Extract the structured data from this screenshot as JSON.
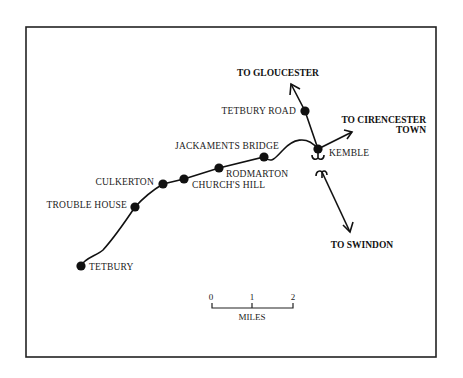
{
  "map": {
    "title": "",
    "frame": {
      "x": 26,
      "y": 27,
      "width": 410,
      "height": 330
    },
    "stations": [
      {
        "name": "TETBURY",
        "x": 81,
        "y": 266,
        "label_x": 89,
        "label_y": 270,
        "anchor": "start"
      },
      {
        "name": "TROUBLE HOUSE",
        "x": 135,
        "y": 207,
        "label_x": 127,
        "label_y": 208,
        "anchor": "end"
      },
      {
        "name": "CULKERTON",
        "x": 163,
        "y": 184,
        "label_x": 154,
        "label_y": 185,
        "anchor": "end"
      },
      {
        "name": "CHURCH'S HILL",
        "x": 184,
        "y": 179,
        "label_x": 192,
        "label_y": 188,
        "anchor": "start"
      },
      {
        "name": "RODMARTON",
        "x": 219,
        "y": 168,
        "label_x": 226,
        "label_y": 177,
        "anchor": "start"
      },
      {
        "name": "JACKAMENTS BRIDGE",
        "x": 264,
        "y": 157,
        "label_x": 279,
        "label_y": 149,
        "anchor": "end"
      },
      {
        "name": "TETBURY ROAD",
        "x": 305,
        "y": 111,
        "label_x": 296,
        "label_y": 114,
        "anchor": "end"
      },
      {
        "name": "KEMBLE",
        "x": 318,
        "y": 149,
        "label_x": 329,
        "label_y": 156,
        "anchor": "start"
      }
    ],
    "destinations": [
      {
        "name": "TO GLOUCESTER",
        "lines": [
          "TO GLOUCESTER"
        ],
        "x": 278,
        "y": 76,
        "anchor": "middle"
      },
      {
        "name": "TO CIRENCESTER TOWN",
        "lines": [
          "TO CIRENCESTER",
          "TOWN"
        ],
        "x": 426,
        "y": 123,
        "anchor": "end"
      },
      {
        "name": "TO SWINDON",
        "lines": [
          "TO SWINDON"
        ],
        "x": 362,
        "y": 248,
        "anchor": "middle"
      }
    ],
    "scale_bar": {
      "ticks": [
        "0",
        "1",
        "2"
      ],
      "unit_label": "MILES"
    },
    "colors": {
      "line": "#111111",
      "frame": "#222222",
      "background": "#ffffff"
    }
  }
}
